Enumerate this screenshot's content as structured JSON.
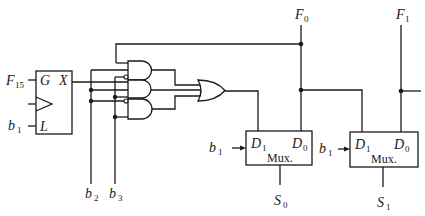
{
  "diagram": {
    "type": "logic-circuit",
    "latch": {
      "inputs": {
        "gate": "G",
        "load": "L",
        "clock": "clock-triangle"
      },
      "output": "X",
      "gate_signal": {
        "main": "F",
        "sub": "15"
      },
      "load_signal": {
        "main": "b",
        "sub": "1"
      }
    },
    "select_lines": [
      {
        "main": "b",
        "sub": "2"
      },
      {
        "main": "b",
        "sub": "3"
      }
    ],
    "and_gates": 3,
    "or_gates": 1,
    "muxes": [
      {
        "label": "Mux.",
        "d1": {
          "main": "D",
          "sub": "1"
        },
        "d0": {
          "main": "D",
          "sub": "0"
        },
        "select_in": {
          "main": "b",
          "sub": "1"
        },
        "output": {
          "main": "S",
          "sub": "0"
        },
        "feedback": {
          "main": "F",
          "sub": "0"
        }
      },
      {
        "label": "Mux.",
        "d1": {
          "main": "D",
          "sub": "1"
        },
        "d0": {
          "main": "D",
          "sub": "0"
        },
        "select_in": {
          "main": "b",
          "sub": "1"
        },
        "output": {
          "main": "S",
          "sub": "1"
        },
        "feedback": {
          "main": "F",
          "sub": "1"
        }
      }
    ]
  }
}
